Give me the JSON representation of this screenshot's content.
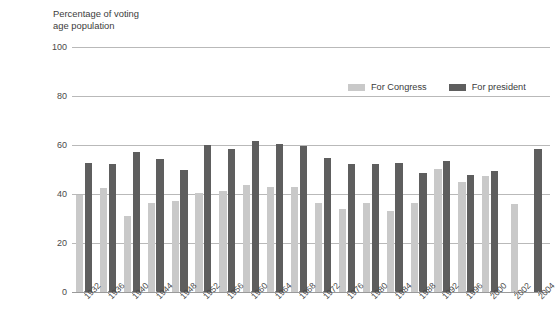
{
  "source_note": {
    "lines": "ureau.\nct of the\nashington,\nrinting"
  },
  "axis_title": "Percentage of voting\nage population",
  "legend": {
    "position": "top-right-inside",
    "items": [
      {
        "label": "For Congress",
        "color": "#c9c9c9",
        "key": "congress"
      },
      {
        "label": "For president",
        "color": "#5e5e5e",
        "key": "president"
      }
    ]
  },
  "colors": {
    "congress": "#c9c9c9",
    "president": "#5e5e5e",
    "gridline": "#b9b9b9",
    "text": "#3c3c3c",
    "background": "#ffffff"
  },
  "chart_data": {
    "type": "bar",
    "title": "",
    "subtitle": "",
    "xlabel": "",
    "ylabel": "Percentage of voting age population",
    "ylim": [
      0,
      100
    ],
    "yticks": [
      0,
      20,
      40,
      60,
      80,
      100
    ],
    "ytick_labels": [
      "0",
      "20",
      "40",
      "60",
      "80",
      "100"
    ],
    "grid": true,
    "legend_position": "upper right",
    "categories": [
      "1932",
      "1936",
      "1940",
      "1944",
      "1948",
      "1952",
      "1956",
      "1960",
      "1964",
      "1968",
      "1972",
      "1976",
      "1980",
      "1984",
      "1988",
      "1992",
      "1996",
      "2000",
      "2002",
      "2004"
    ],
    "series": [
      {
        "name": "For Congress",
        "color": "#c9c9c9",
        "values": [
          39.7,
          42.5,
          31.2,
          36.2,
          37.1,
          40.3,
          41.3,
          43.6,
          43.0,
          43.0,
          36.2,
          34.0,
          36.2,
          33.0,
          36.3,
          50.3,
          45.1,
          47.5,
          36.0,
          null
        ]
      },
      {
        "name": "For president",
        "color": "#5e5e5e",
        "values": [
          52.6,
          52.2,
          57.0,
          54.1,
          50.0,
          60.1,
          58.3,
          61.5,
          60.5,
          59.4,
          54.7,
          52.3,
          52.2,
          52.8,
          48.5,
          53.6,
          47.8,
          49.5,
          null,
          58.2
        ]
      }
    ]
  }
}
